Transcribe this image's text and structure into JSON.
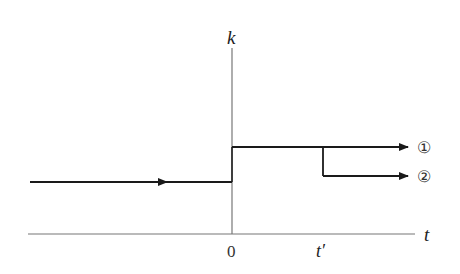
{
  "diagram": {
    "y_axis_label": "k",
    "x_axis_label": "t",
    "origin_label": "0",
    "t_prime_label": "t′",
    "path_1_label": "①",
    "path_2_label": "②",
    "colors": {
      "axis": "#777777",
      "path": "#1a1a1a",
      "background": "#ffffff"
    }
  }
}
